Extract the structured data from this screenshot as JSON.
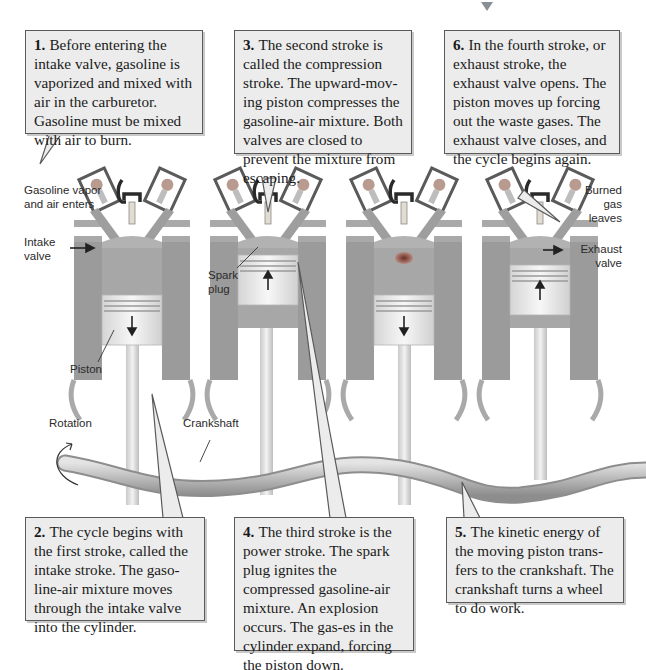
{
  "figure": {
    "colors": {
      "callout_bg": "#ececec",
      "callout_border": "#5a5a5a",
      "cylinder": "#9b9b9b",
      "piston": "#e6e6e6",
      "crankshaft": "#b8b8b8",
      "explosion": "#8a4a3a"
    }
  },
  "callouts": [
    {
      "id": "1",
      "number": "1.",
      "text": "Before entering the intake valve, gasoline is vaporized and mixed with air in the carburetor. Gasoline must be mixed with air to burn."
    },
    {
      "id": "2",
      "number": "2.",
      "text": "The cycle begins with the first stroke, called the intake stroke. The gaso-line-air mixture moves through the intake valve into the cylinder."
    },
    {
      "id": "3",
      "number": "3.",
      "text": "The second stroke is called the compression stroke. The upward-mov-ing piston compresses the gasoline-air mixture. Both valves are closed to prevent the mixture from escaping."
    },
    {
      "id": "4",
      "number": "4.",
      "text": "The third stroke is the power stroke. The spark plug ignites the compressed gasoline-air mixture. An explosion occurs. The gas-es in the cylinder expand, forcing the piston down."
    },
    {
      "id": "5",
      "number": "5.",
      "text": "The kinetic energy of the moving piston trans-fers to the crankshaft. The crankshaft turns a wheel to do work."
    },
    {
      "id": "6",
      "number": "6.",
      "text": "In the fourth stroke, or exhaust stroke, the exhaust valve opens. The piston moves up forcing out the waste gases. The exhaust valve closes, and the cycle begins again."
    }
  ],
  "labels": {
    "gasoline_vapor": "Gasoline vapor and air enters",
    "intake_valve": "Intake valve",
    "spark_plug": "Spark plug",
    "piston": "Piston",
    "rotation": "Rotation",
    "crankshaft": "Crankshaft",
    "burned_gas": "Burned gas leaves",
    "exhaust_valve": "Exhaust valve"
  },
  "cylinders": [
    {
      "stroke": "intake",
      "piston_direction": "down"
    },
    {
      "stroke": "compression",
      "piston_direction": "up"
    },
    {
      "stroke": "power",
      "piston_direction": "down"
    },
    {
      "stroke": "exhaust",
      "piston_direction": "up"
    }
  ]
}
